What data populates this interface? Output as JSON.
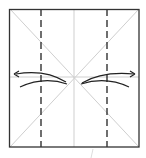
{
  "diagram": {
    "type": "origami-fold-diagram",
    "colors": {
      "outline": "#333333",
      "crease": "#c8c8c8",
      "fold_line": "#222222",
      "arrow": "#222222",
      "background": "#ffffff"
    },
    "square": {
      "x": 9,
      "y": 9,
      "size": 130
    },
    "valley_folds": [
      {
        "name": "left-valley-fold",
        "x": 41
      },
      {
        "name": "right-valley-fold",
        "x": 107
      }
    ],
    "center_crease_x": 74,
    "arrows": [
      {
        "name": "left-fold-arrow",
        "direction": "left"
      },
      {
        "name": "right-fold-arrow",
        "direction": "right"
      }
    ]
  }
}
